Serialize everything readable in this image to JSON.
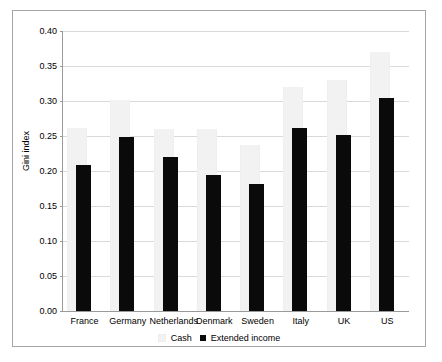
{
  "chart_data": {
    "type": "bar",
    "title": "",
    "xlabel": "",
    "ylabel": "Gini index",
    "ylim": [
      0.0,
      0.4
    ],
    "ytick_values": [
      0.4,
      0.35,
      0.3,
      0.25,
      0.2,
      0.15,
      0.1,
      0.05,
      0.0
    ],
    "ytick_labels": [
      "0.40",
      "0.35",
      "0.30",
      "0.25",
      "0.20",
      "0.15",
      "0.10",
      "0.05",
      "0.00"
    ],
    "grid": true,
    "legend_position": "bottom",
    "categories": [
      "France",
      "Germany",
      "Netherlands",
      "Denmark",
      "Sweden",
      "Italy",
      "UK",
      "US"
    ],
    "series": [
      {
        "name": "Cash",
        "color": "#f2f2f2",
        "values": [
          0.262,
          0.301,
          0.26,
          0.26,
          0.237,
          0.32,
          0.33,
          0.37
        ]
      },
      {
        "name": "Extended income",
        "color": "#0a0a0a",
        "values": [
          0.209,
          0.249,
          0.22,
          0.195,
          0.182,
          0.262,
          0.252,
          0.305
        ]
      }
    ]
  }
}
